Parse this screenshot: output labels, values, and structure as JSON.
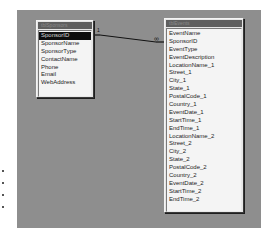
{
  "canvas": {
    "background_color": "#8e8e8e"
  },
  "tables": [
    {
      "title": "tblSponsors",
      "fields": [
        "SponsorID",
        "SponsorName",
        "SponsorType",
        "ContactName",
        "Phone",
        "Email",
        "WebAddress"
      ],
      "selected_field": "SponsorID"
    },
    {
      "title": "tblEvents",
      "fields": [
        "EventName",
        "SponsorID",
        "EventType",
        "EventDescription",
        "LocationName_1",
        "Street_1",
        "City_1",
        "State_1",
        "PostalCode_1",
        "Country_1",
        "EventDate_1",
        "StartTime_1",
        "EndTime_1",
        "LocationName_2",
        "Street_2",
        "City_2",
        "State_2",
        "PostalCode_2",
        "Country_2",
        "EventDate_2",
        "StartTime_2",
        "EndTime_2"
      ]
    }
  ],
  "relationship": {
    "from_table": "tblSponsors",
    "from_field": "SponsorID",
    "to_table": "tblEvents",
    "to_field": "SponsorID",
    "one_side_label": "1",
    "many_side_label": "∞"
  }
}
